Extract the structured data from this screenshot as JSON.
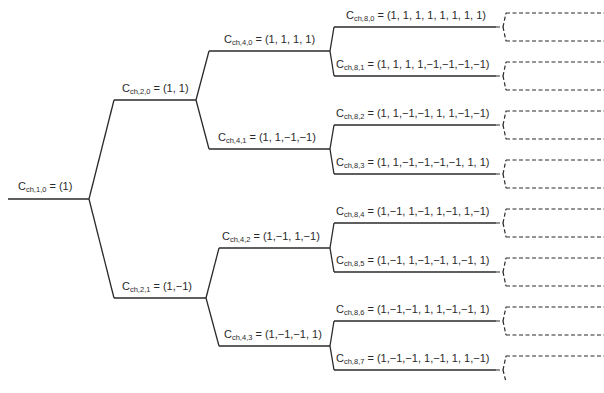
{
  "diagram": {
    "type": "ovsf-code-tree",
    "base_symbol": "C",
    "subscript_prefix": "ch",
    "line_color": "#2a2a2a",
    "nodes": [
      {
        "id": "ch-1-0",
        "sf": "1",
        "index": "0",
        "sub": "ch,1,0",
        "code": "(1)",
        "label_x": 18,
        "label_y": 180,
        "x1": 8,
        "x2": 89,
        "y": 199
      },
      {
        "id": "ch-2-0",
        "sf": "2",
        "index": "0",
        "sub": "ch,2,0",
        "code": "(1, 1)",
        "label_x": 122,
        "label_y": 82,
        "x1": 114,
        "x2": 196,
        "y": 100
      },
      {
        "id": "ch-2-1",
        "sf": "2",
        "index": "1",
        "sub": "ch,2,1",
        "code": "(1,−1)",
        "label_x": 122,
        "label_y": 280,
        "x1": 114,
        "x2": 206,
        "y": 298
      },
      {
        "id": "ch-4-0",
        "sf": "4",
        "index": "0",
        "sub": "ch,4,0",
        "code": "(1, 1, 1, 1)",
        "label_x": 224,
        "label_y": 33,
        "x1": 209,
        "x2": 330,
        "y": 51
      },
      {
        "id": "ch-4-1",
        "sf": "4",
        "index": "1",
        "sub": "ch,4,1",
        "code": "(1, 1,−1,−1)",
        "label_x": 218,
        "label_y": 131,
        "x1": 209,
        "x2": 330,
        "y": 149
      },
      {
        "id": "ch-4-2",
        "sf": "4",
        "index": "2",
        "sub": "ch,4,2",
        "code": "(1,−1, 1,−1)",
        "label_x": 222,
        "label_y": 230,
        "x1": 219,
        "x2": 330,
        "y": 248
      },
      {
        "id": "ch-4-3",
        "sf": "4",
        "index": "3",
        "sub": "ch,4,3",
        "code": "(1,−1,−1, 1)",
        "label_x": 224,
        "label_y": 328,
        "x1": 219,
        "x2": 330,
        "y": 346
      },
      {
        "id": "ch-8-0",
        "sf": "8",
        "index": "0",
        "sub": "ch,8,0",
        "code": "(1, 1, 1, 1, 1, 1, 1, 1)",
        "label_x": 346,
        "label_y": 9,
        "x1": 334,
        "x2": 496,
        "y": 27
      },
      {
        "id": "ch-8-1",
        "sf": "8",
        "index": "1",
        "sub": "ch,8,1",
        "code": "(1, 1, 1, 1,−1,−1,−1,−1)",
        "label_x": 336,
        "label_y": 58,
        "x1": 334,
        "x2": 496,
        "y": 76
      },
      {
        "id": "ch-8-2",
        "sf": "8",
        "index": "2",
        "sub": "ch,8,2",
        "code": "(1, 1,−1,−1, 1, 1,−1,−1)",
        "label_x": 336,
        "label_y": 107,
        "x1": 334,
        "x2": 496,
        "y": 125
      },
      {
        "id": "ch-8-3",
        "sf": "8",
        "index": "3",
        "sub": "ch,8,3",
        "code": "(1, 1,−1,−1,−1,−1, 1, 1)",
        "label_x": 336,
        "label_y": 156,
        "x1": 334,
        "x2": 496,
        "y": 174
      },
      {
        "id": "ch-8-4",
        "sf": "8",
        "index": "4",
        "sub": "ch,8,4",
        "code": "(1,−1, 1,−1, 1,−1, 1,−1)",
        "label_x": 336,
        "label_y": 205,
        "x1": 334,
        "x2": 496,
        "y": 223
      },
      {
        "id": "ch-8-5",
        "sf": "8",
        "index": "5",
        "sub": "ch,8,5",
        "code": "(1,−1, 1,−1,−1, 1,−1, 1)",
        "label_x": 336,
        "label_y": 254,
        "x1": 334,
        "x2": 496,
        "y": 272
      },
      {
        "id": "ch-8-6",
        "sf": "8",
        "index": "6",
        "sub": "ch,8,6",
        "code": "(1,−1,−1, 1, 1,−1,−1, 1)",
        "label_x": 336,
        "label_y": 303,
        "x1": 334,
        "x2": 496,
        "y": 321
      },
      {
        "id": "ch-8-7",
        "sf": "8",
        "index": "7",
        "sub": "ch,8,7",
        "code": "(1,−1,−1, 1,−1, 1, 1,−1)",
        "label_x": 336,
        "label_y": 352,
        "x1": 334,
        "x2": 496,
        "y": 370
      }
    ],
    "edges": [
      [
        "ch-1-0",
        "ch-2-0"
      ],
      [
        "ch-1-0",
        "ch-2-1"
      ],
      [
        "ch-2-0",
        "ch-4-0"
      ],
      [
        "ch-2-0",
        "ch-4-1"
      ],
      [
        "ch-2-1",
        "ch-4-2"
      ],
      [
        "ch-2-1",
        "ch-4-3"
      ],
      [
        "ch-4-0",
        "ch-8-0"
      ],
      [
        "ch-4-0",
        "ch-8-1"
      ],
      [
        "ch-4-1",
        "ch-8-2"
      ],
      [
        "ch-4-1",
        "ch-8-3"
      ],
      [
        "ch-4-2",
        "ch-8-4"
      ],
      [
        "ch-4-2",
        "ch-8-5"
      ],
      [
        "ch-4-3",
        "ch-8-6"
      ],
      [
        "ch-4-3",
        "ch-8-7"
      ]
    ],
    "continuation": {
      "style": "dashed",
      "note": "each SF=8 code continues to two dashed branches (SF=16)"
    }
  }
}
